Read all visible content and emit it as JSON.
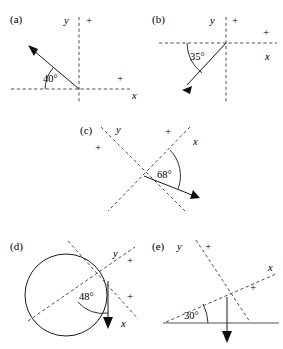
{
  "figure": {
    "type": "geometry-diagram",
    "background_color": "#ffffff",
    "axis_color": "#3a3a3a",
    "ray_color": "#1a1a1a",
    "width": 283,
    "height": 349
  },
  "panels": [
    {
      "id": "a",
      "label": "(a)",
      "angle_label": "40°",
      "axis_x_label": "x",
      "axis_y_label": "y",
      "plus_marks": [
        "+",
        "+"
      ],
      "origin": {
        "x": 79,
        "y": 89
      },
      "ray_direction_deg": 140,
      "axes_rotation_deg": 0,
      "has_circle": false,
      "has_ground_line": false
    },
    {
      "id": "b",
      "label": "(b)",
      "angle_label": "35°",
      "axis_x_label": "x",
      "axis_y_label": "y",
      "plus_marks": [
        "+",
        "+"
      ],
      "origin": {
        "x": 226,
        "y": 43
      },
      "ray_direction_deg": 215,
      "axes_rotation_deg": 0,
      "has_circle": false,
      "has_ground_line": false
    },
    {
      "id": "c",
      "label": "(c)",
      "angle_label": "68°",
      "axis_x_label": "x",
      "axis_y_label": "y",
      "plus_marks": [
        "+",
        "+"
      ],
      "origin": {
        "x": 144,
        "y": 176
      },
      "ray_direction_deg": -22,
      "axes_rotation_deg": 45,
      "has_circle": false,
      "has_ground_line": false
    },
    {
      "id": "d",
      "label": "(d)",
      "angle_label": "48°",
      "axis_x_label": "x",
      "axis_y_label": "y",
      "plus_marks": [
        "+",
        "+"
      ],
      "origin": {
        "x": 108,
        "y": 281
      },
      "ray_direction_deg": -90,
      "axes_rotation_deg": 42,
      "has_circle": true,
      "circle": {
        "cx": 66,
        "cy": 295,
        "r": 41
      },
      "has_ground_line": false
    },
    {
      "id": "e",
      "label": "(e)",
      "angle_label": "30°",
      "axis_x_label": "x",
      "axis_y_label": "y",
      "plus_marks": [
        "+",
        "+"
      ],
      "origin": {
        "x": 227,
        "y": 297
      },
      "ray_direction_deg": -90,
      "axes_rotation_deg": 30,
      "has_circle": false,
      "has_ground_line": true
    }
  ]
}
